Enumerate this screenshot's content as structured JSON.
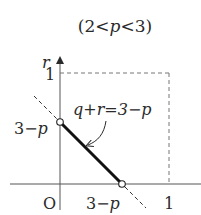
{
  "title": "(2<p<3)",
  "axes": {
    "x_label": "",
    "y_label": "r",
    "origin_label": "O",
    "x_ticks": [
      {
        "value": "3-p",
        "label": "3−p"
      },
      {
        "value": 1,
        "label": "1"
      }
    ],
    "y_ticks": [
      {
        "value": "3-p",
        "label": "3−p"
      },
      {
        "value": 1,
        "label": "1"
      }
    ]
  },
  "line": {
    "equation_label": "q+r=3−p",
    "segment": {
      "from": "(0, 3−p)",
      "to": "(3−p, 0)",
      "endpoints": "open"
    },
    "extension_style": "dashed"
  },
  "bounding_square": {
    "from": [
      0,
      0
    ],
    "to": [
      1,
      1
    ],
    "style": "dashed"
  },
  "colors": {
    "ink": "#2a2a2a",
    "segment": "#111111",
    "dashed": "#777777",
    "background": "#ffffff"
  }
}
